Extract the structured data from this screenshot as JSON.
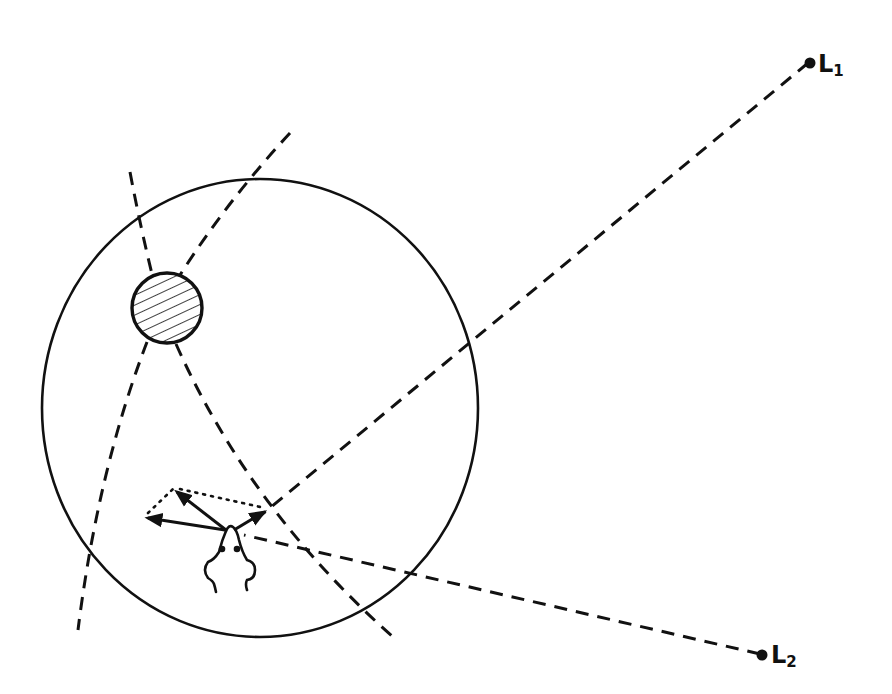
{
  "diagram": {
    "colors": {
      "stroke": "#111111",
      "background": "#ffffff"
    },
    "arena": {
      "cx": 260,
      "cy": 408,
      "rx": 218,
      "ry": 229
    },
    "landmark": {
      "cx": 167,
      "cy": 308,
      "r": 35,
      "fill": "hatched"
    },
    "lights": [
      {
        "id": "L1",
        "letter": "L",
        "subscript": "1",
        "x": 808,
        "y": 62
      },
      {
        "id": "L2",
        "letter": "L",
        "subscript": "2",
        "x": 762,
        "y": 655
      }
    ],
    "animal": {
      "head_x": 230,
      "head_y": 527,
      "icon": "rodent-top-view-icon"
    },
    "vectors": [
      {
        "name": "vector-left",
        "from": [
          225,
          530
        ],
        "to": [
          144,
          517
        ]
      },
      {
        "name": "vector-up-left",
        "from": [
          225,
          530
        ],
        "to": [
          173,
          489
        ]
      },
      {
        "name": "vector-right",
        "from": [
          233,
          530
        ],
        "to": [
          267,
          510
        ]
      }
    ]
  }
}
